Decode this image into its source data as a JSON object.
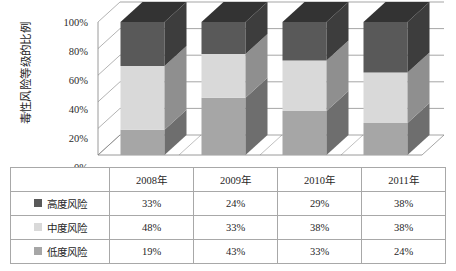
{
  "chart_data": {
    "type": "bar",
    "subtype": "stacked-100-percent-3d",
    "title": "",
    "xlabel": "",
    "ylabel": "毒性风险等级的比例",
    "categories": [
      "2008年",
      "2009年",
      "2010年",
      "2011年"
    ],
    "series": [
      {
        "name": "高度风险",
        "values": [
          33,
          24,
          29,
          38
        ],
        "labels": [
          "33%",
          "24%",
          "29%",
          "38%"
        ],
        "color": "#595959",
        "stack_order": 3
      },
      {
        "name": "中度风险",
        "values": [
          48,
          33,
          38,
          38
        ],
        "labels": [
          "48%",
          "33%",
          "38%",
          "38%"
        ],
        "color": "#d9d9d9",
        "stack_order": 2
      },
      {
        "name": "低度风险",
        "values": [
          19,
          43,
          33,
          24
        ],
        "labels": [
          "19%",
          "43%",
          "33%",
          "24%"
        ],
        "color": "#a6a6a6",
        "stack_order": 1
      }
    ],
    "ylim": [
      0,
      100
    ],
    "yticks": [
      0,
      20,
      40,
      60,
      80,
      100
    ],
    "ytick_labels": [
      "0%",
      "20%",
      "40%",
      "60%",
      "80%",
      "100%"
    ],
    "grid": true,
    "legend_position": "table-below"
  },
  "yaxis": {
    "title": "毒性风险等级的比例",
    "ticks": [
      {
        "label": "100%",
        "value": 100
      },
      {
        "label": "80%",
        "value": 80
      },
      {
        "label": "60%",
        "value": 60
      },
      {
        "label": "40%",
        "value": 40
      },
      {
        "label": "20%",
        "value": 20
      },
      {
        "label": "0%",
        "value": 0
      }
    ]
  },
  "table": {
    "header_row": [
      "",
      "2008年",
      "2009年",
      "2010年",
      "2011年"
    ],
    "rows": [
      {
        "label": "高度风险",
        "swatch_color": "#595959",
        "values": [
          "33%",
          "24%",
          "29%",
          "38%"
        ]
      },
      {
        "label": "中度风险",
        "swatch_color": "#d9d9d9",
        "values": [
          "48%",
          "33%",
          "38%",
          "38%"
        ]
      },
      {
        "label": "低度风险",
        "swatch_color": "#a6a6a6",
        "values": [
          "19%",
          "43%",
          "33%",
          "24%"
        ]
      }
    ]
  },
  "colors": {
    "high_risk_front": "#595959",
    "high_risk_side": "#3d3d3d",
    "high_risk_top": "#333333",
    "medium_risk_front": "#d9d9d9",
    "medium_risk_side": "#8f8f8f",
    "low_risk_front": "#a6a6a6",
    "low_risk_side": "#6e6e6e",
    "gridline": "#808080",
    "axis": "#808080",
    "table_border": "#a8a8a8",
    "background": "#ffffff"
  }
}
